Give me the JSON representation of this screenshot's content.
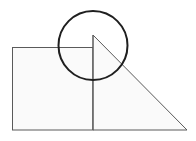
{
  "figure": {
    "title": "Geometric composition: square, right triangle and circle",
    "canvas": {
      "width": 196,
      "height": 141,
      "background_color": "#ffffff"
    },
    "colors": {
      "shape_fill": "#fafafa",
      "shape_stroke": "#5a5a5a",
      "circle_stroke": "#1f1f1f",
      "circle_fill": "none"
    },
    "shapes": [
      {
        "name": "square",
        "type": "rect",
        "x": 12.5,
        "y": 47.5,
        "width": 80.5,
        "height": 82.5,
        "fill": "#fafafa",
        "stroke": "#5a5a5a",
        "stroke_width": 1
      },
      {
        "name": "right-triangle",
        "type": "polygon",
        "points": "93,35 187,130 93,130",
        "fill": "#fafafa",
        "stroke": "#5a5a5a",
        "stroke_width": 1
      },
      {
        "name": "circle",
        "type": "circle",
        "cx": 93,
        "cy": 45.5,
        "r": 34.5,
        "fill": "none",
        "stroke": "#1f1f1f",
        "stroke_width": 2
      },
      {
        "name": "vertical-shared-edge",
        "type": "line",
        "x1": 93,
        "y1": 35,
        "x2": 93,
        "y2": 130,
        "stroke": "#5a5a5a",
        "stroke_width": 1
      }
    ]
  }
}
